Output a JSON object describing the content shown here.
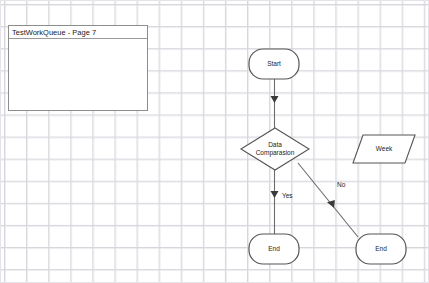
{
  "app": {
    "canvas_width": 429,
    "canvas_height": 283,
    "background_color": "#ffffff",
    "grid_color": "#d6d6dc",
    "grid_size_px": 22,
    "border_color": "#e3e3e8"
  },
  "panel": {
    "title": "TestWorkQueue - Page 7",
    "border_color": "#8d8d8d",
    "background_color": "#ffffff"
  },
  "diagram": {
    "type": "flowchart",
    "stroke_color": "#555555",
    "text_color": "#1b1b1b",
    "nodes": [
      {
        "id": "start",
        "shape": "rounded-rectangle",
        "label": "Start",
        "x": 248,
        "y": 48,
        "w": 50,
        "h": 30
      },
      {
        "id": "decision",
        "shape": "diamond",
        "label_line1": "Data",
        "label_line2": "Comparasion",
        "label": "Data Comparasion",
        "cx": 274,
        "cy": 148,
        "rx": 34,
        "ry": 21
      },
      {
        "id": "week",
        "shape": "parallelogram",
        "label": "Week",
        "x": 352,
        "y": 134,
        "w": 62,
        "h": 28
      },
      {
        "id": "end-yes",
        "shape": "rounded-rectangle",
        "label": "End",
        "x": 248,
        "y": 233,
        "w": 50,
        "h": 30
      },
      {
        "id": "end-no",
        "shape": "rounded-rectangle",
        "label": "End",
        "x": 355,
        "y": 233,
        "w": 50,
        "h": 30
      }
    ],
    "edges": [
      {
        "id": "start-to-decision",
        "from": "start",
        "to": "decision",
        "label": "",
        "arrow_at": "end"
      },
      {
        "id": "decision-to-end-yes",
        "from": "decision",
        "to": "end-yes",
        "label": "Yes",
        "label_x": 281,
        "label_y": 191,
        "arrow_at": "middle"
      },
      {
        "id": "end-no-to-decision",
        "from": "end-no",
        "to": "decision",
        "label": "No",
        "label_x": 336,
        "label_y": 180,
        "arrow_at": "middle"
      }
    ]
  }
}
